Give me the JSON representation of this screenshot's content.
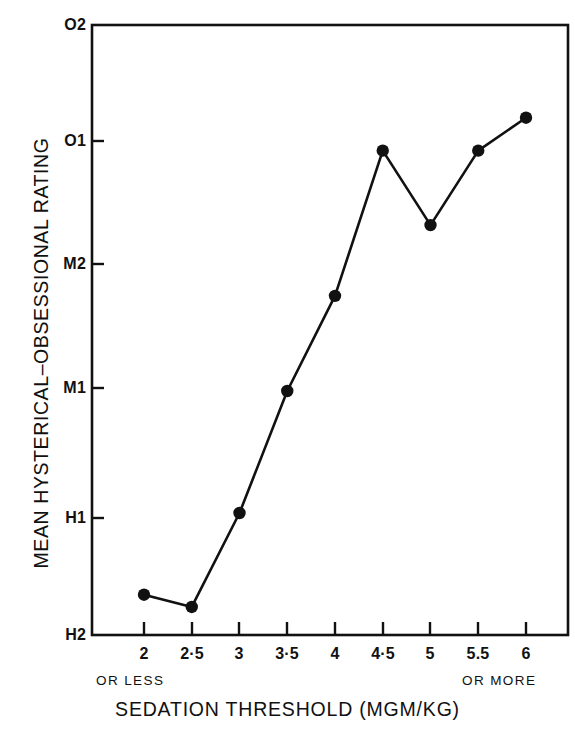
{
  "chart_data": {
    "type": "line",
    "title": "",
    "xlabel": "SEDATION THRESHOLD (MGM/KG)",
    "ylabel": "MEAN HYSTERICAL–OBSESSIONAL RATING",
    "x_tick_labels": [
      "2",
      "2·5",
      "3",
      "3·5",
      "4",
      "4·5",
      "5",
      "5.5",
      "6"
    ],
    "x_values": [
      2,
      2.5,
      3,
      3.5,
      4,
      4.5,
      5,
      5.5,
      6
    ],
    "x_axis_notes": {
      "left": "OR LESS",
      "right": "OR MORE"
    },
    "y_tick_labels": [
      "O2",
      "O1",
      "M2",
      "M1",
      "H1",
      "H2"
    ],
    "y_tick_values": [
      5,
      4,
      3,
      2,
      1,
      0
    ],
    "ylim": [
      0,
      5
    ],
    "y_category_order_top_to_bottom": [
      "O2",
      "O1",
      "M2",
      "M1",
      "H1",
      "H2"
    ],
    "values": [
      0.33,
      0.23,
      1.0,
      2.0,
      2.78,
      3.97,
      3.36,
      3.97,
      4.24
    ],
    "point_labels": [
      "H2+",
      "H2+",
      "H1",
      "M1",
      "M1-M2",
      "O1",
      "M2-O1",
      "O1",
      "O1+"
    ],
    "grid": false,
    "legend": null,
    "marker": "filled-circle",
    "line_color": "#111111",
    "marker_color": "#111111",
    "background_color": "#ffffff",
    "frame": "box"
  },
  "axes": {
    "y_ticks_inside": true,
    "x_ticks_inside": true
  }
}
